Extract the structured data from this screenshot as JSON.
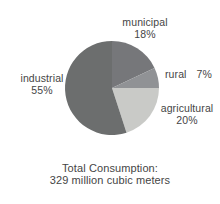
{
  "background_color": "#ffffff",
  "text_color": "#454545",
  "chart_data": {
    "type": "pie",
    "direction": "clockwise",
    "start_angle_deg": 0,
    "slices": [
      {
        "label": "municipal",
        "pct": "18%",
        "value": 18,
        "color": "#76777a"
      },
      {
        "label": "rural",
        "pct": "7%",
        "value": 7,
        "color": "#909295"
      },
      {
        "label": "agricultural",
        "pct": "20%",
        "value": 20,
        "color": "#c9cac7"
      },
      {
        "label": "industrial",
        "pct": "55%",
        "value": 55,
        "color": "#6c6e6e"
      }
    ],
    "caption": {
      "line1": "Total Consumption:",
      "line2": "329 million cubic meters"
    }
  }
}
